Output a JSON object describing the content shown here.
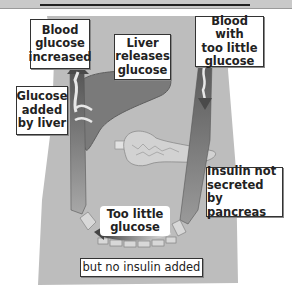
{
  "title": {
    "prefix": "Insulin is",
    "emphasis": "NOT ADDED"
  },
  "labels": {
    "blood_glucose_increased": "Blood\nglucose\nincreased",
    "liver_releases_glucose": "Liver\nreleases\nglucose",
    "blood_too_little_glucose": "Blood with\ntoo little\nglucose",
    "glucose_added_by_liver": "Glucose\nadded\nby liver",
    "insulin_not_secreted": "Insulin not\nsecreted by\npancreas",
    "too_little_glucose": "Too little\nglucose",
    "no_insulin_added": "but no insulin added"
  },
  "colors": {
    "body": "#bdbdbd",
    "liver": "#7a7a7a",
    "vessel": "#6e6e6e",
    "pancreas": "#d0d0d0",
    "label_bg": "#ffffff",
    "label_border": "#333333"
  }
}
